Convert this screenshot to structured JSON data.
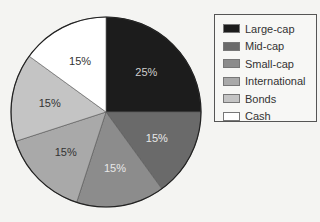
{
  "chart_data": {
    "type": "pie",
    "title": "",
    "categories": [
      "Large-cap",
      "Mid-cap",
      "Small-cap",
      "International",
      "Bonds",
      "Cash"
    ],
    "values": [
      25,
      15,
      15,
      15,
      15,
      15
    ],
    "labels": [
      "25%",
      "15%",
      "15%",
      "15%",
      "15%",
      "15%"
    ],
    "colors": [
      "#1c1c1c",
      "#6a6a6a",
      "#8c8c8c",
      "#a9a9a9",
      "#c4c4c4",
      "#ffffff"
    ],
    "label_colors": [
      "#cfcfcf",
      "#e8e8e8",
      "#e8e8e8",
      "#333333",
      "#333333",
      "#333333"
    ],
    "start_angle": "top, clockwise",
    "legend_position": "right"
  },
  "legend": {
    "items": [
      {
        "label": "Large-cap",
        "color": "#1c1c1c"
      },
      {
        "label": "Mid-cap",
        "color": "#6a6a6a"
      },
      {
        "label": "Small-cap",
        "color": "#8c8c8c"
      },
      {
        "label": "International",
        "color": "#a9a9a9"
      },
      {
        "label": "Bonds",
        "color": "#c4c4c4"
      },
      {
        "label": "Cash",
        "color": "#ffffff"
      }
    ]
  }
}
